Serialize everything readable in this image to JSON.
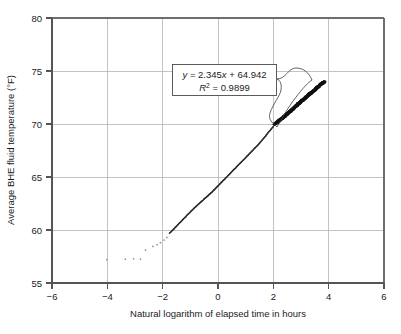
{
  "chart_data": {
    "type": "scatter",
    "title": "",
    "xlabel": "Natural logarithm of elapsed time in hours",
    "ylabel": "Average BHE fluid temperature (°F)",
    "xlim": [
      -6,
      6
    ],
    "ylim": [
      55,
      80
    ],
    "xticks": [
      "−6",
      "−4",
      "−2",
      "0",
      "2",
      "4",
      "6"
    ],
    "xtick_values": [
      -6,
      -4,
      -2,
      0,
      2,
      4,
      6
    ],
    "yticks": [
      "55",
      "60",
      "65",
      "70",
      "75",
      "80"
    ],
    "ytick_values": [
      55,
      60,
      65,
      70,
      75,
      80
    ],
    "grid": true,
    "legend": "none",
    "annotations": {
      "equation": "y = 2.345x + 64.942",
      "equation_y": "y",
      "equation_rest": " = 2.345",
      "equation_x": "x",
      "equation_tail": " + 64.942",
      "r_squared_symbol": "R",
      "r_squared_exp": "2",
      "r_squared_value": " = 0.9899",
      "r_squared_full": "R² = 0.9899",
      "slope": 2.345,
      "intercept": 64.942,
      "r_squared": 0.9899
    },
    "series": [
      {
        "name": "Sparse early readings",
        "style": "faint-dots",
        "x": [
          -4.02,
          -3.35,
          -3.05,
          -2.8,
          -2.62,
          -2.35,
          -2.2,
          -2.08,
          -1.95,
          -1.85
        ],
        "y": [
          57.2,
          57.25,
          57.28,
          57.26,
          58.1,
          58.45,
          58.6,
          58.8,
          59.05,
          59.3
        ]
      },
      {
        "name": "BHE fluid temperature response",
        "style": "dense-line-of-dots",
        "x": [
          -1.75,
          -1.6,
          -1.45,
          -1.3,
          -1.15,
          -1.0,
          -0.85,
          -0.7,
          -0.55,
          -0.4,
          -0.25,
          -0.1,
          0.05,
          0.2,
          0.35,
          0.5,
          0.65,
          0.8,
          0.95,
          1.1,
          1.25,
          1.4,
          1.55,
          1.7,
          1.85,
          2.0
        ],
        "y": [
          59.7,
          60.1,
          60.5,
          60.9,
          61.3,
          61.7,
          62.1,
          62.45,
          62.8,
          63.15,
          63.5,
          63.9,
          64.3,
          64.7,
          65.1,
          65.5,
          65.9,
          66.3,
          66.7,
          67.1,
          67.5,
          67.9,
          68.35,
          68.8,
          69.3,
          69.75
        ]
      },
      {
        "name": "Bold late-time fit region",
        "style": "thick-band",
        "x": [
          2.05,
          2.2,
          2.35,
          2.5,
          2.65,
          2.8,
          2.95,
          3.1,
          3.25,
          3.4,
          3.55,
          3.7,
          3.85
        ],
        "y": [
          70.0,
          70.3,
          70.6,
          70.95,
          71.3,
          71.65,
          72.0,
          72.35,
          72.7,
          73.0,
          73.35,
          73.7,
          74.0
        ]
      }
    ]
  }
}
